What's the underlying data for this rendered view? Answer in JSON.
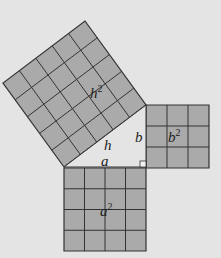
{
  "diagram": {
    "colors": {
      "background": "#e4e4e4",
      "square_fill": "#aaaaaa",
      "grid_line": "#333333",
      "triangle_fill": "#e4e4e4"
    },
    "triangle": {
      "vertices": [
        [
          64,
          167
        ],
        [
          146,
          167
        ],
        [
          146,
          105
        ]
      ],
      "side_labels": {
        "a": "a",
        "b": "b",
        "h": "h"
      }
    },
    "squares": [
      {
        "name": "h-square",
        "label_base": "h",
        "label_exp": "2",
        "grid": 5,
        "corners": [
          [
            64,
            167
          ],
          [
            146,
            105
          ],
          [
            85,
            21
          ],
          [
            3,
            83
          ]
        ],
        "label_pos": [
          90,
          98
        ]
      },
      {
        "name": "b-square",
        "label_base": "b",
        "label_exp": "2",
        "grid": 3,
        "corners": [
          [
            146,
            105
          ],
          [
            209,
            105
          ],
          [
            209,
            168
          ],
          [
            146,
            168
          ]
        ],
        "label_pos": [
          168,
          142
        ]
      },
      {
        "name": "a-square",
        "label_base": "a",
        "label_exp": "2",
        "grid": 4,
        "corners": [
          [
            64,
            168
          ],
          [
            146,
            168
          ],
          [
            146,
            251
          ],
          [
            64,
            251
          ]
        ],
        "label_pos": [
          100,
          216
        ]
      }
    ],
    "labels": [
      {
        "name": "label-h",
        "text": "h",
        "x": 104,
        "y": 150
      },
      {
        "name": "label-b",
        "text": "b",
        "x": 135,
        "y": 142
      },
      {
        "name": "label-a",
        "text": "a",
        "x": 101,
        "y": 166
      }
    ]
  }
}
